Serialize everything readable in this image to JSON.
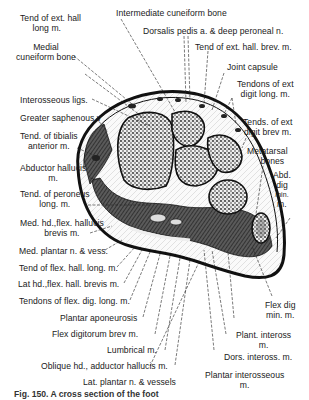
{
  "figure": {
    "caption": "Fig. 150.  A cross section of the foot",
    "colors": {
      "ink": "#1a1a1a",
      "background": "#ffffff",
      "bone_fill": "#3a3a3a",
      "muscle_fill": "#4a4a4a"
    }
  },
  "labels": {
    "left": [
      {
        "id": "tend_ext_hall_long",
        "lines": [
          "Tend of ext. hall",
          "long m."
        ]
      },
      {
        "id": "medial_cuneiform",
        "lines": [
          "Medial",
          "cuneiform  bone"
        ]
      },
      {
        "id": "interosseous_ligs",
        "lines": [
          "Interosseous  ligs."
        ]
      },
      {
        "id": "greater_saphenous",
        "lines": [
          "Greater saphenous  v"
        ]
      },
      {
        "id": "tend_tibialis_ant",
        "lines": [
          "Tend. of tibialis",
          "anterior m."
        ]
      },
      {
        "id": "abductor_hallucis",
        "lines": [
          "Abductor hallucis",
          "m."
        ]
      },
      {
        "id": "tend_peroneus_long",
        "lines": [
          "Tend. of peroneus",
          "long. m."
        ]
      },
      {
        "id": "med_hd_flex_hall_brev",
        "lines": [
          "Med. hd.,flex. hallucis",
          "brevis  m."
        ]
      },
      {
        "id": "med_plantar_n_vess",
        "lines": [
          "Med. plantar n. & vess."
        ]
      },
      {
        "id": "tend_flex_hall_long",
        "lines": [
          "Tend of flex. hall. long. m."
        ]
      },
      {
        "id": "lat_hd_flex_hall_brev",
        "lines": [
          "Lat hd.,flex. hall. brevis m."
        ]
      },
      {
        "id": "tendons_flex_dig_long",
        "lines": [
          "Tendons of flex. dig. long. m."
        ]
      },
      {
        "id": "plantar_aponeurosis",
        "lines": [
          "Plantar  aponeurosis"
        ]
      },
      {
        "id": "flex_digitorum_brev",
        "lines": [
          "Flex digitorum  brev  m."
        ]
      },
      {
        "id": "lumbrical",
        "lines": [
          "Lumbrical m."
        ]
      },
      {
        "id": "oblique_hd_add_hall",
        "lines": [
          "Oblique  hd., adductor hallucis  m."
        ]
      },
      {
        "id": "lat_plantar_n_vessels",
        "lines": [
          "Lat. plantar  n. & vessels"
        ]
      }
    ],
    "top": [
      {
        "id": "intermediate_cuneiform",
        "lines": [
          "Intermediate  cuneiform bone"
        ]
      },
      {
        "id": "dorsalis_pedis",
        "lines": [
          "Dorsalis pedis a. & deep peroneal n."
        ]
      },
      {
        "id": "tend_ext_hall_brev",
        "lines": [
          "Tend of ext. hall. brev. m."
        ]
      },
      {
        "id": "joint_capsule",
        "lines": [
          "Joint  capsule"
        ]
      }
    ],
    "right": [
      {
        "id": "tendons_ext_digit_long",
        "lines": [
          "Tendons of ext",
          "digit long. m."
        ]
      },
      {
        "id": "tends_ext_digit_brev",
        "lines": [
          "Tends. of ext",
          "digit brev m."
        ]
      },
      {
        "id": "metatarsal_bones",
        "lines": [
          "Metatarsal",
          "bones"
        ]
      },
      {
        "id": "abd_dig_min",
        "lines": [
          "Abd.",
          "dig",
          "min.",
          "m."
        ]
      },
      {
        "id": "flex_dig_min",
        "lines": [
          "Flex dig",
          "min. m."
        ]
      },
      {
        "id": "plant_inteross",
        "lines": [
          "Plant. inteross",
          "m."
        ]
      },
      {
        "id": "dors_inteross",
        "lines": [
          "Dors. inteross. m."
        ]
      },
      {
        "id": "plantar_interosseous",
        "lines": [
          "Plantar  interosseous",
          "m."
        ]
      }
    ]
  }
}
